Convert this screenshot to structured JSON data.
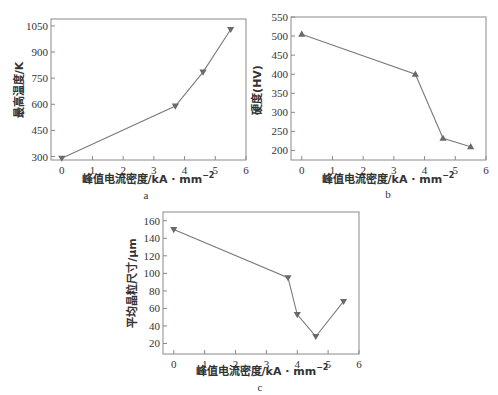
{
  "chart_data": [
    {
      "panel": "a",
      "type": "line",
      "title": "",
      "xlabel": "峰值电流密度/kA·mm⁻²",
      "ylabel": "最高温度/K",
      "x": [
        0,
        3.7,
        4.6,
        5.5
      ],
      "values": [
        290,
        590,
        785,
        1030
      ],
      "xlim": [
        -0.35,
        6
      ],
      "ylim": [
        280,
        1090
      ],
      "xticks": [
        0,
        1,
        2,
        3,
        4,
        5,
        6
      ],
      "yticks": [
        300,
        450,
        600,
        750,
        900,
        1050
      ],
      "marker": "down-triangle",
      "grid": false,
      "legend": null
    },
    {
      "panel": "b",
      "type": "line",
      "title": "",
      "xlabel": "峰值电流密度/kA·mm⁻²",
      "ylabel": "硬度(HV)",
      "x": [
        0,
        3.7,
        4.6,
        5.5
      ],
      "values": [
        505,
        400,
        232,
        210
      ],
      "xlim": [
        -0.35,
        6
      ],
      "ylim": [
        175,
        550
      ],
      "xticks": [
        0,
        1,
        2,
        3,
        4,
        5,
        6
      ],
      "yticks": [
        200,
        250,
        300,
        350,
        400,
        450,
        500,
        550
      ],
      "marker": "up-triangle",
      "grid": false,
      "legend": null
    },
    {
      "panel": "c",
      "type": "line",
      "title": "",
      "xlabel": "峰值电流密度/kA·mm⁻²",
      "ylabel": "平均晶粒尺寸/μm",
      "x": [
        0,
        3.7,
        4.0,
        4.6,
        5.5
      ],
      "values": [
        150,
        95,
        53,
        28,
        68
      ],
      "xlim": [
        -0.35,
        6
      ],
      "ylim": [
        8,
        170
      ],
      "xticks": [
        0,
        1,
        2,
        3,
        4,
        5,
        6
      ],
      "yticks": [
        20,
        40,
        60,
        80,
        100,
        120,
        140,
        160
      ],
      "marker": "down-triangle",
      "grid": false,
      "legend": null
    }
  ],
  "panels": {
    "a": {
      "label": "a",
      "xlabel": "峰值电流密度/kA · mm",
      "xlabel_sup": "−2",
      "ylabel": "最高温度/K"
    },
    "b": {
      "label": "b",
      "xlabel": "峰值电流密度/kA · mm",
      "xlabel_sup": "−2",
      "ylabel": "硬度(HV)"
    },
    "c": {
      "label": "c",
      "xlabel": "峰值电流密度/kA · mm",
      "xlabel_sup": "−2",
      "ylabel": "平均晶粒尺寸/μm"
    }
  }
}
